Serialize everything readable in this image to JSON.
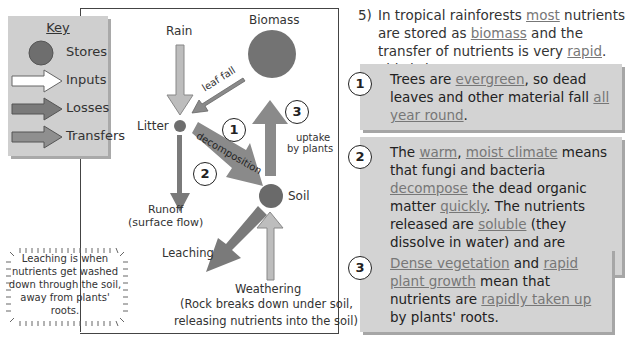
{
  "key": {
    "title": "Key",
    "items": [
      {
        "label": "Stores",
        "icon": "store-circle-icon"
      },
      {
        "label": "Inputs",
        "icon": "input-arrow-icon"
      },
      {
        "label": "Losses",
        "icon": "loss-arrow-icon"
      },
      {
        "label": "Transfers",
        "icon": "transfer-arrow-icon"
      }
    ]
  },
  "diagram": {
    "rain": "Rain",
    "biomass": "Biomass",
    "litter": "Litter",
    "soil": "Soil",
    "leaf_fall": "leaf fall",
    "decomposition": "decomposition",
    "uptake_line1": "uptake",
    "uptake_line2": "by plants",
    "runoff_line1": "Runoff",
    "runoff_line2": "(surface flow)",
    "leaching": "Leaching",
    "weathering": "Weathering",
    "weathering_note_line1": "(Rock breaks down under soil,",
    "weathering_note_line2": "releasing nutrients into the soil)",
    "markers": [
      "1",
      "2",
      "3"
    ]
  },
  "leaching_note": {
    "line1": "Leaching is when",
    "line2": "nutrients get washed",
    "line3": "down through the soil,",
    "line4": "away from plants' roots."
  },
  "question": {
    "number": "5)",
    "intro": [
      {
        "t": "In tropical rainforests ",
        "u": false
      },
      {
        "t": "most",
        "u": true
      },
      {
        "t": " nutrients are stored as ",
        "u": false
      },
      {
        "t": "biomass",
        "u": true
      },
      {
        "t": " and the transfer of nutrients is very ",
        "u": false
      },
      {
        "t": "rapid",
        "u": true
      },
      {
        "t": ".  This is because:",
        "u": false
      }
    ],
    "reasons": [
      {
        "number": "1",
        "parts": [
          {
            "t": "Trees are ",
            "u": false
          },
          {
            "t": "evergreen",
            "u": true
          },
          {
            "t": ", so dead leaves and other material fall ",
            "u": false
          },
          {
            "t": "all year round",
            "u": true
          },
          {
            "t": ".",
            "u": false
          }
        ]
      },
      {
        "number": "2",
        "parts": [
          {
            "t": "The ",
            "u": false
          },
          {
            "t": "warm",
            "u": true
          },
          {
            "t": ", ",
            "u": false
          },
          {
            "t": "moist climate",
            "u": true
          },
          {
            "t": " means that fungi and bacteria ",
            "u": false
          },
          {
            "t": "decompose",
            "u": true
          },
          {
            "t": " the dead organic matter ",
            "u": false
          },
          {
            "t": "quickly",
            "u": true
          },
          {
            "t": ".  The nutrients released are ",
            "u": false
          },
          {
            "t": "soluble",
            "u": true
          },
          {
            "t": " (they dissolve in water) and are soaked up by the ",
            "u": false
          },
          {
            "t": "soil",
            "u": true
          },
          {
            "t": ".",
            "u": false
          }
        ]
      },
      {
        "number": "3",
        "parts": [
          {
            "t": "Dense vegetation",
            "u": true
          },
          {
            "t": " and ",
            "u": false
          },
          {
            "t": "rapid plant growth",
            "u": true
          },
          {
            "t": " mean that nutrients are ",
            "u": false
          },
          {
            "t": "rapidly taken up",
            "u": true
          },
          {
            "t": " by plants' roots.",
            "u": false
          }
        ]
      }
    ]
  },
  "colors": {
    "store": "#707070",
    "input": "#bdbdbd",
    "loss": "#7a7a7a",
    "transfer": "#8f8f8f",
    "panel": "#d3d3d3",
    "underline_text": "#777777"
  }
}
